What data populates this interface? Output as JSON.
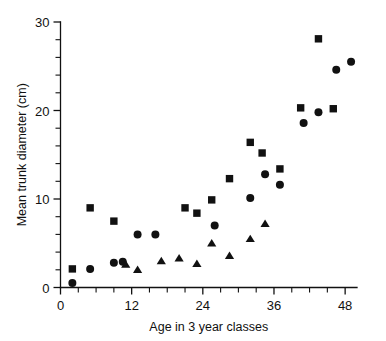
{
  "chart_data": {
    "type": "scatter",
    "title": "",
    "xlabel": "Age in 3 year classes",
    "ylabel": "Mean trunk diameter (cm)",
    "xlim": [
      0,
      50
    ],
    "ylim": [
      0,
      30
    ],
    "xticks": [
      0,
      12,
      24,
      36,
      48
    ],
    "xticklabels": [
      "0",
      "12",
      "24",
      "36",
      "48"
    ],
    "x_minor_step": 3,
    "yticks": [
      0,
      10,
      20,
      30
    ],
    "yticklabels": [
      "0",
      "10",
      "20",
      "30"
    ],
    "y_minor_step": 2,
    "grid": false,
    "legend": "none",
    "series": [
      {
        "name": "squares",
        "marker": "square",
        "points": [
          {
            "x": 2.0,
            "y": 2.1
          },
          {
            "x": 5.0,
            "y": 9.0
          },
          {
            "x": 9.0,
            "y": 7.5
          },
          {
            "x": 21.0,
            "y": 9.0
          },
          {
            "x": 23.0,
            "y": 8.4
          },
          {
            "x": 25.5,
            "y": 9.9
          },
          {
            "x": 28.5,
            "y": 12.3
          },
          {
            "x": 32.0,
            "y": 16.4
          },
          {
            "x": 34.0,
            "y": 15.2
          },
          {
            "x": 37.0,
            "y": 13.4
          },
          {
            "x": 40.5,
            "y": 20.3
          },
          {
            "x": 43.5,
            "y": 28.1
          },
          {
            "x": 46.0,
            "y": 20.2
          }
        ]
      },
      {
        "name": "circles",
        "marker": "circle",
        "points": [
          {
            "x": 2.0,
            "y": 0.5
          },
          {
            "x": 5.0,
            "y": 2.1
          },
          {
            "x": 9.0,
            "y": 2.8
          },
          {
            "x": 10.5,
            "y": 2.9
          },
          {
            "x": 13.0,
            "y": 6.0
          },
          {
            "x": 16.0,
            "y": 6.0
          },
          {
            "x": 26.0,
            "y": 7.0
          },
          {
            "x": 32.0,
            "y": 10.1
          },
          {
            "x": 34.5,
            "y": 12.8
          },
          {
            "x": 37.0,
            "y": 11.6
          },
          {
            "x": 41.0,
            "y": 18.6
          },
          {
            "x": 43.5,
            "y": 19.8
          },
          {
            "x": 46.5,
            "y": 24.6
          },
          {
            "x": 49.0,
            "y": 25.5
          }
        ]
      },
      {
        "name": "triangles",
        "marker": "triangle",
        "points": [
          {
            "x": 11.0,
            "y": 2.6
          },
          {
            "x": 13.0,
            "y": 2.0
          },
          {
            "x": 17.0,
            "y": 3.0
          },
          {
            "x": 20.0,
            "y": 3.3
          },
          {
            "x": 23.0,
            "y": 2.7
          },
          {
            "x": 25.5,
            "y": 5.0
          },
          {
            "x": 28.5,
            "y": 3.6
          },
          {
            "x": 32.0,
            "y": 5.5
          },
          {
            "x": 34.5,
            "y": 7.2
          }
        ]
      }
    ]
  }
}
